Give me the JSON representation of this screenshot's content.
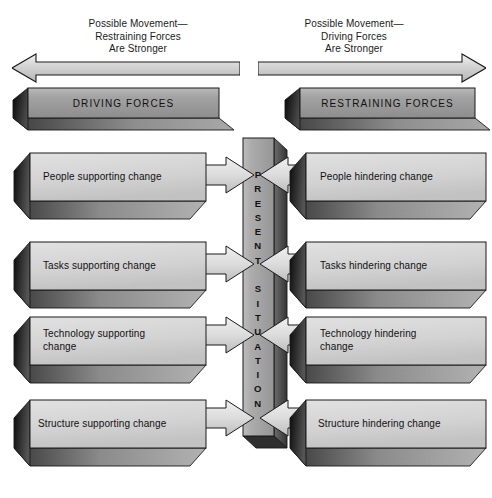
{
  "colors": {
    "slab_face": "#d2d2d2",
    "slab_face_light": "#dcdcdc",
    "slab_side_dark": "#2a2a2a",
    "slab_bottom": "#8c8c8c",
    "banner_face": "#9a9a9a",
    "pillar_face": "#a8a8a8",
    "arrow_fill": "#d8d8d8",
    "outline": "#1a1a1a",
    "background": "#ffffff",
    "text": "#111111"
  },
  "header": {
    "left_caption": "Possible Movement—\nRestraining Forces\nAre Stronger",
    "right_caption": "Possible Movement—\nDriving Forces\nAre Stronger",
    "left_arrow_direction": "left",
    "right_arrow_direction": "right"
  },
  "banners": {
    "left": "DRIVING FORCES",
    "right": "RESTRAINING FORCES"
  },
  "center": {
    "label": "PRESENT SITUATION",
    "label_vertical": "P\nR\nE\nS\nE\nN\nT\n \nS\nI\nT\nU\nA\nT\nI\nO\nN"
  },
  "driving_forces": [
    {
      "label": "People supporting change"
    },
    {
      "label": "Tasks supporting change"
    },
    {
      "label": "Technology supporting\nchange"
    },
    {
      "label": "Structure supporting change"
    }
  ],
  "restraining_forces": [
    {
      "label": "People hindering change"
    },
    {
      "label": "Tasks hindering change"
    },
    {
      "label": "Technology hindering\nchange"
    },
    {
      "label": "Structure hindering change"
    }
  ]
}
